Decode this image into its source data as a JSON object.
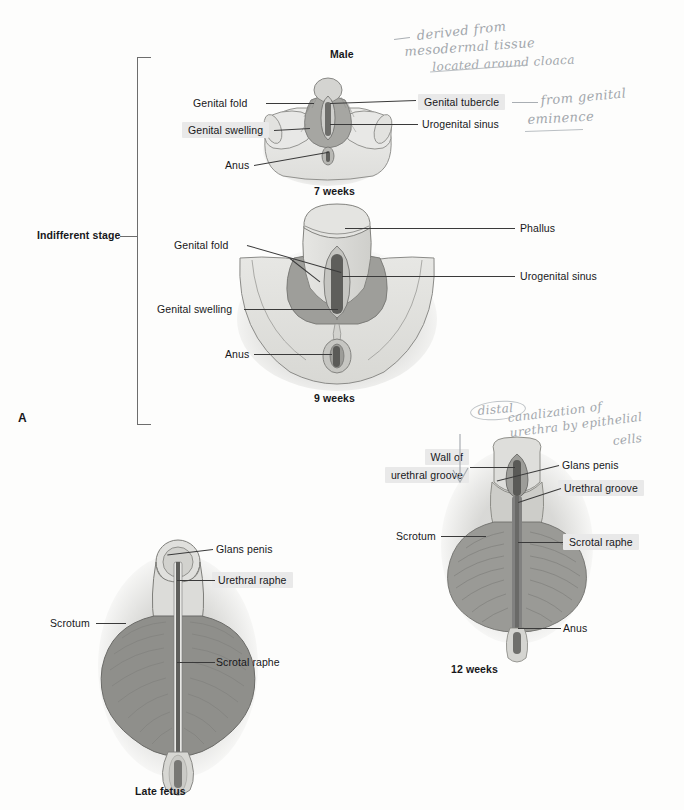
{
  "figure": {
    "panel_letter": "A",
    "bracket_label": "Indifferent stage"
  },
  "panels": [
    {
      "id": "seven-weeks",
      "title": "Male",
      "caption": "7 weeks",
      "labels": [
        {
          "name": "genital-fold",
          "text": "Genital fold",
          "highlighted": false
        },
        {
          "name": "genital-swelling",
          "text": "Genital swelling",
          "highlighted": true
        },
        {
          "name": "anus",
          "text": "Anus",
          "highlighted": false
        },
        {
          "name": "genital-tubercle",
          "text": "Genital tubercle",
          "highlighted": true
        },
        {
          "name": "urogenital-sinus",
          "text": "Urogenital sinus",
          "highlighted": false
        }
      ]
    },
    {
      "id": "nine-weeks",
      "title": "",
      "caption": "9 weeks",
      "labels": [
        {
          "name": "genital-fold",
          "text": "Genital fold",
          "highlighted": false
        },
        {
          "name": "genital-swelling",
          "text": "Genital swelling",
          "highlighted": false
        },
        {
          "name": "anus",
          "text": "Anus",
          "highlighted": false
        },
        {
          "name": "phallus",
          "text": "Phallus",
          "highlighted": false
        },
        {
          "name": "urogenital-sinus",
          "text": "Urogenital sinus",
          "highlighted": false
        }
      ]
    },
    {
      "id": "twelve-weeks",
      "title": "",
      "caption": "12 weeks",
      "labels": [
        {
          "name": "wall-of-urethral-groove-line1",
          "text": "Wall of",
          "highlighted": true
        },
        {
          "name": "wall-of-urethral-groove-line2",
          "text": "urethral groove",
          "highlighted": true
        },
        {
          "name": "glans-penis",
          "text": "Glans penis",
          "highlighted": false
        },
        {
          "name": "urethral-groove",
          "text": "Urethral groove",
          "highlighted": true
        },
        {
          "name": "scrotum",
          "text": "Scrotum",
          "highlighted": false
        },
        {
          "name": "scrotal-raphe",
          "text": "Scrotal raphe",
          "highlighted": true
        },
        {
          "name": "anus",
          "text": "Anus",
          "highlighted": false
        }
      ]
    },
    {
      "id": "late-fetus",
      "title": "",
      "caption": "Late fetus",
      "labels": [
        {
          "name": "glans-penis",
          "text": "Glans penis",
          "highlighted": false
        },
        {
          "name": "urethral-raphe",
          "text": "Urethral raphe",
          "highlighted": true
        },
        {
          "name": "scrotum",
          "text": "Scrotum",
          "highlighted": false
        },
        {
          "name": "scrotal-raphe",
          "text": "Scrotal raphe",
          "highlighted": false
        }
      ]
    }
  ],
  "annotations": [
    {
      "name": "handwriting-mesoderm-line1",
      "text": "derived from"
    },
    {
      "name": "handwriting-mesoderm-line2",
      "text": "mesodermal tissue"
    },
    {
      "name": "handwriting-mesoderm-line3",
      "text": "located around cloaca"
    },
    {
      "name": "handwriting-eminence-line1",
      "text": "from genital"
    },
    {
      "name": "handwriting-eminence-line2",
      "text": "eminence"
    },
    {
      "name": "handwriting-canalization-line1",
      "text": "distal"
    },
    {
      "name": "handwriting-canalization-line2",
      "text": "canalization of"
    },
    {
      "name": "handwriting-canalization-line3",
      "text": "urethra by epithelial"
    },
    {
      "name": "handwriting-canalization-line4",
      "text": "cells"
    }
  ],
  "colors": {
    "ink": "#17171a",
    "leader": "#3a3a3a",
    "highlight": "#e9e9e9",
    "pencil": "#9aa0a6",
    "tissue_light": "#e3e3e1",
    "tissue_mid": "#c9c9c6",
    "tissue_dark": "#9c9c99",
    "tissue_darker": "#7d7d7a",
    "groove": "#6a6a67"
  }
}
